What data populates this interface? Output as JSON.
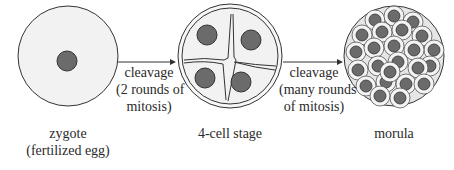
{
  "diagram": {
    "stages": [
      {
        "id": "zygote",
        "label_lines": [
          "zygote",
          "(fertilized egg)"
        ]
      },
      {
        "id": "four_cell",
        "label_lines": [
          "4-cell stage"
        ]
      },
      {
        "id": "morula",
        "label_lines": [
          "morula"
        ]
      }
    ],
    "transitions": [
      {
        "from": "zygote",
        "to": "four_cell",
        "label_lines": [
          "cleavage",
          "(2 rounds of",
          "mitosis)"
        ]
      },
      {
        "from": "four_cell",
        "to": "morula",
        "label_lines": [
          "cleavage",
          "(many rounds",
          "of mitosis)"
        ]
      }
    ],
    "colors": {
      "cell_fill": "#f2f2f2",
      "outline": "#333333",
      "nucleus": "#6b6b6b",
      "morula_bg": "#d9d9d9"
    }
  }
}
